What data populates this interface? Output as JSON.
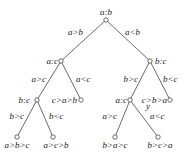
{
  "diagram": {
    "type": "decision-tree",
    "nodes": {
      "root": {
        "label": "a:b"
      },
      "n_ac": {
        "label": "a:c"
      },
      "n_bc_right": {
        "label": "b:c"
      },
      "n_bc_left": {
        "label": "b:c"
      },
      "leaf_cab": {
        "label": "c>a>b"
      },
      "n_ac_right": {
        "label": "a:c"
      },
      "leaf_cba": {
        "label": "c>b>a"
      },
      "leaf_abc": {
        "label": "a>b>c"
      },
      "leaf_acb": {
        "label": "a>c>b"
      },
      "leaf_bac": {
        "label": "b>a>c"
      },
      "leaf_bca": {
        "label": "b>c>a"
      }
    },
    "edges": {
      "root_left": {
        "label": "a>b"
      },
      "root_right": {
        "label": "a<b"
      },
      "ac_left": {
        "label": "a>c"
      },
      "ac_right": {
        "label": "a<c"
      },
      "bcr_left": {
        "label": "b>c"
      },
      "bcr_right": {
        "label": "b<c"
      },
      "bcl_left": {
        "label": "b>c"
      },
      "bcl_right": {
        "label": "b<c"
      },
      "acr_left": {
        "label": "a>c"
      },
      "acr_right": {
        "label": "a<c"
      }
    },
    "annotation": {
      "label": "y"
    }
  }
}
